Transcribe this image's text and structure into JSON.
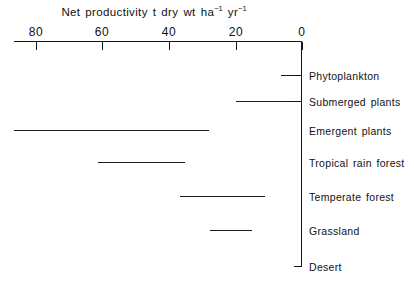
{
  "chart_data": {
    "type": "bar",
    "orientation": "horizontal",
    "xlabel": "Net productivity t dry wt ha-1 yr-1",
    "ylabel": "",
    "xlim": [
      90,
      0
    ],
    "axis_reversed": true,
    "grid": false,
    "legend": false,
    "xticks": [
      80,
      60,
      40,
      20,
      0
    ],
    "xtick_labels": [
      "80",
      "60",
      "40",
      "20",
      "0"
    ],
    "categories": [
      "Phytoplankton",
      "Submerged plants",
      "Emergent plants",
      "Tropical rain forest",
      "Temperate forest",
      "Grassland",
      "Desert"
    ],
    "ranges": [
      {
        "category": "Phytoplankton",
        "low": 0,
        "high": 6
      },
      {
        "category": "Submerged plants",
        "low": 0,
        "high": 20
      },
      {
        "category": "Emergent plants",
        "low": 28,
        "high": 87
      },
      {
        "category": "Tropical rain forest",
        "low": 35,
        "high": 60
      },
      {
        "category": "Temperate forest",
        "low": 11,
        "high": 37
      },
      {
        "category": "Grassland",
        "low": 15,
        "high": 28
      },
      {
        "category": "Desert",
        "low": 0,
        "high": 0
      }
    ],
    "values_low": [
      0,
      0,
      28,
      35,
      11,
      15,
      0
    ],
    "values_high": [
      6,
      20,
      87,
      60,
      37,
      28,
      0
    ],
    "units": "t dry wt ha-1 yr-1"
  },
  "title_parts": {
    "main": "Net productivity t dry wt ha",
    "sup1": "−1",
    "mid": " yr",
    "sup2": "−1"
  },
  "colors": {
    "background": "#ffffff",
    "ink": "#151515",
    "bar": "#1b1b1b"
  },
  "ticks": [
    {
      "label": "80",
      "value": 80,
      "x": 36
    },
    {
      "label": "60",
      "value": 60,
      "x": 102
    },
    {
      "label": "40",
      "value": 40,
      "x": 169
    },
    {
      "label": "20",
      "value": 20,
      "x": 236
    },
    {
      "label": "0",
      "value": 0,
      "x": 302
    }
  ],
  "rows": [
    {
      "label": "Phytoplankton",
      "y": 75,
      "bar_left": 281,
      "bar_right": 302,
      "tick": true
    },
    {
      "label": "Submerged plants",
      "y": 101,
      "bar_left": 236,
      "bar_right": 302,
      "tick": true
    },
    {
      "label": "Emergent plants",
      "y": 130,
      "bar_left": 14,
      "bar_right": 209,
      "tick": false
    },
    {
      "label": "Tropical rain forest",
      "y": 162,
      "bar_left": 98,
      "bar_right": 185,
      "tick": false
    },
    {
      "label": "Temperate forest",
      "y": 196,
      "bar_left": 180,
      "bar_right": 265,
      "tick": false
    },
    {
      "label": "Grassland",
      "y": 230,
      "bar_left": 210,
      "bar_right": 252,
      "tick": false
    },
    {
      "label": "Desert",
      "y": 266,
      "bar_left": 294,
      "bar_right": 302,
      "tick": true
    }
  ]
}
